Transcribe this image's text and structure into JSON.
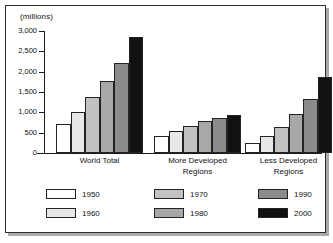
{
  "chart_data": {
    "type": "bar",
    "title": "",
    "subtitle": "",
    "xlabel": "",
    "ylabel": "(millions)",
    "unit_label": "(millions)",
    "categories": [
      "World  Total",
      "More  Developed\nRegions",
      "Less  Developed\nRegions"
    ],
    "category_labels_flat": [
      "World Total",
      "More Developed Regions",
      "Less Developed Regions"
    ],
    "series": [
      {
        "name": "1950",
        "color": "#ffffff",
        "values": [
          725,
          420,
          250
        ]
      },
      {
        "name": "1960",
        "color": "#e8e8e6",
        "values": [
          1000,
          545,
          420
        ]
      },
      {
        "name": "1970",
        "color": "#c2c2c0",
        "values": [
          1375,
          675,
          640
        ]
      },
      {
        "name": "1980",
        "color": "#a8a8a6",
        "values": [
          1760,
          780,
          950
        ]
      },
      {
        "name": "1990",
        "color": "#8b8b89",
        "values": [
          2225,
          860,
          1330
        ]
      },
      {
        "name": "2000",
        "color": "#111111",
        "values": [
          2850,
          945,
          1875
        ]
      }
    ],
    "ylim": [
      0,
      3000
    ],
    "yticks": [
      0,
      500,
      1000,
      1500,
      2000,
      2500,
      3000
    ],
    "ytick_labels": [
      "0",
      "500",
      "1,000",
      "1,500",
      "2,000",
      "2,500",
      "3,000"
    ],
    "grid": false,
    "legend_position": "bottom",
    "legend_columns": 3,
    "legend_rows": 2
  },
  "legend": {
    "entries": [
      {
        "label": "1950",
        "color": "#ffffff"
      },
      {
        "label": "1960",
        "color": "#e8e8e6"
      },
      {
        "label": "1970",
        "color": "#c2c2c0"
      },
      {
        "label": "1980",
        "color": "#a8a8a6"
      },
      {
        "label": "1990",
        "color": "#8b8b89"
      },
      {
        "label": "2000",
        "color": "#111111"
      }
    ]
  }
}
